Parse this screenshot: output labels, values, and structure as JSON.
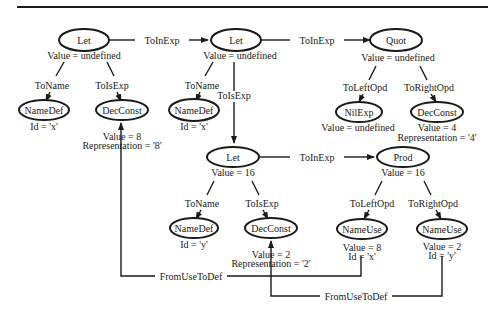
{
  "diagram": {
    "type": "attributed-syntax-tree",
    "nodes": {
      "let1": {
        "label": "Let",
        "attrs": [
          "Value = undefined"
        ]
      },
      "namedef1": {
        "label": "NameDef",
        "attrs": [
          "Id = 'x'"
        ]
      },
      "decconst1": {
        "label": "DecConst",
        "attrs": [
          "Value = 8",
          "Representation = '8'"
        ]
      },
      "let2": {
        "label": "Let",
        "attrs": [
          "Value = undefined"
        ]
      },
      "namedef2": {
        "label": "NameDef",
        "attrs": [
          "Id = 'x'"
        ]
      },
      "quot": {
        "label": "Quot",
        "attrs": [
          "Value = undefined"
        ]
      },
      "nilexp": {
        "label": "NilExp",
        "attrs": [
          "Value = undefined"
        ]
      },
      "decconst2": {
        "label": "DecConst",
        "attrs": [
          "Value = 4",
          "Representation = '4'"
        ]
      },
      "let3": {
        "label": "Let",
        "attrs": [
          "Value = 16"
        ]
      },
      "namedef3": {
        "label": "NameDef",
        "attrs": [
          "Id = 'y'"
        ]
      },
      "decconst3": {
        "label": "DecConst",
        "attrs": [
          "Value = 2",
          "Representation = '2'"
        ]
      },
      "prod": {
        "label": "Prod",
        "attrs": [
          "Value = 16"
        ]
      },
      "nameuse1": {
        "label": "NameUse",
        "attrs": [
          "Value = 8",
          "Id = 'x'"
        ]
      },
      "nameuse2": {
        "label": "NameUse",
        "attrs": [
          "Value = 2",
          "Id = 'y'"
        ]
      }
    },
    "edges": {
      "e1": {
        "from": "let1",
        "to": "namedef1",
        "label": "ToName"
      },
      "e2": {
        "from": "let1",
        "to": "decconst1",
        "label": "ToIsExp"
      },
      "e3": {
        "from": "let1",
        "to": "let2",
        "label": "ToInExp"
      },
      "e4": {
        "from": "let2",
        "to": "namedef2",
        "label": "ToName"
      },
      "e5": {
        "from": "let2",
        "to": "let3",
        "label": "ToIsExp"
      },
      "e6": {
        "from": "let2",
        "to": "quot",
        "label": "ToInExp"
      },
      "e7": {
        "from": "quot",
        "to": "nilexp",
        "label": "ToLeftOpd"
      },
      "e8": {
        "from": "quot",
        "to": "decconst2",
        "label": "ToRightOpd"
      },
      "e9": {
        "from": "let3",
        "to": "namedef3",
        "label": "ToName"
      },
      "e10": {
        "from": "let3",
        "to": "decconst3",
        "label": "ToIsExp"
      },
      "e11": {
        "from": "let3",
        "to": "prod",
        "label": "ToInExp"
      },
      "e12": {
        "from": "prod",
        "to": "nameuse1",
        "label": "ToLeftOpd"
      },
      "e13": {
        "from": "prod",
        "to": "nameuse2",
        "label": "ToRightOpd"
      },
      "e14": {
        "from": "nameuse1",
        "to": "decconst1",
        "label": "FromUseToDef"
      },
      "e15": {
        "from": "nameuse2",
        "to": "decconst3",
        "label": "FromUseToDef"
      }
    }
  }
}
